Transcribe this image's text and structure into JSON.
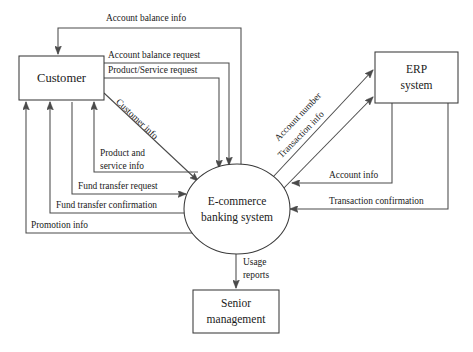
{
  "diagram": {
    "type": "data-flow-diagram",
    "colors": {
      "line": "#4a4a4a",
      "node_stroke": "#3a3a3a",
      "background": "#ffffff",
      "text": "#1a1a1a"
    },
    "nodes": [
      {
        "id": "customer",
        "label": "Customer",
        "shape": "rectangle",
        "x": 19,
        "y": 56,
        "width": 85,
        "height": 44
      },
      {
        "id": "erp",
        "label_line1": "ERP",
        "label_line2": "system",
        "shape": "rectangle",
        "x": 375,
        "y": 52,
        "width": 83,
        "height": 51
      },
      {
        "id": "ecommerce",
        "label_line1": "E-commerce",
        "label_line2": "banking system",
        "shape": "circle",
        "cx": 237,
        "cy": 209,
        "rx": 53,
        "ry": 45
      },
      {
        "id": "senior",
        "label_line1": "Senior",
        "label_line2": "management",
        "shape": "rectangle",
        "x": 193,
        "y": 290,
        "width": 86,
        "height": 43
      }
    ],
    "flows": [
      {
        "id": "account-balance-info",
        "label": "Account balance info",
        "from": "ecommerce",
        "to": "customer"
      },
      {
        "id": "account-balance-request",
        "label": "Account balance request",
        "from": "customer",
        "to": "ecommerce"
      },
      {
        "id": "product-service-request",
        "label": "Product/Service request",
        "from": "customer",
        "to": "ecommerce"
      },
      {
        "id": "customer-info",
        "label": "Customer info",
        "from": "customer",
        "to": "ecommerce"
      },
      {
        "id": "product-and-service-info",
        "label_line1": "Product and",
        "label_line2": "service info",
        "from": "ecommerce",
        "to": "customer"
      },
      {
        "id": "fund-transfer-request",
        "label": "Fund transfer request",
        "from": "customer",
        "to": "ecommerce"
      },
      {
        "id": "fund-transfer-confirmation",
        "label": "Fund transfer confirmation",
        "from": "ecommerce",
        "to": "customer"
      },
      {
        "id": "promotion-info",
        "label": "Promotion info",
        "from": "ecommerce",
        "to": "customer"
      },
      {
        "id": "account-number",
        "label": "Account number",
        "from": "ecommerce",
        "to": "erp"
      },
      {
        "id": "transaction-info",
        "label": "Transaction info",
        "from": "ecommerce",
        "to": "erp"
      },
      {
        "id": "account-info",
        "label": "Account info",
        "from": "erp",
        "to": "ecommerce"
      },
      {
        "id": "transaction-confirmation",
        "label": "Transaction confirmation",
        "from": "erp",
        "to": "ecommerce"
      },
      {
        "id": "usage-reports",
        "label_line1": "Usage",
        "label_line2": "reports",
        "from": "ecommerce",
        "to": "senior"
      }
    ]
  }
}
